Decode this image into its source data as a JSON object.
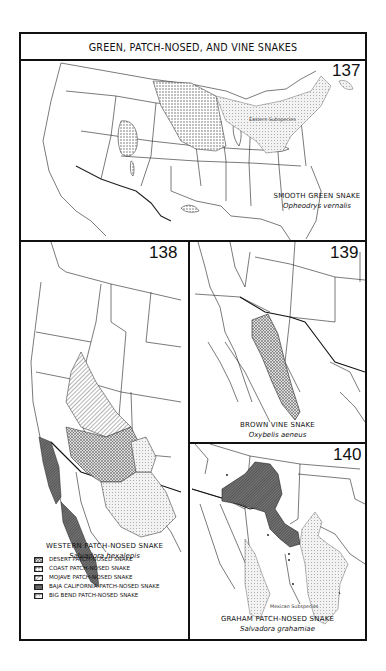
{
  "page": {
    "title": "GREEN, PATCH-NOSED, AND VINE SNAKES"
  },
  "maps": [
    {
      "number": "137",
      "common_name": "SMOOTH GREEN SNAKE",
      "scientific_name": "Opheodrys vernalis",
      "sublabel": "Eastern Subspecies"
    },
    {
      "number": "138",
      "common_name": "WESTERN PATCH-NOSED SNAKE",
      "scientific_name": "Salvadora hexalepis",
      "legend": [
        {
          "label": "DESERT PATCH-NOSED SNAKE",
          "pattern": "desert"
        },
        {
          "label": "COAST PATCH-NOSED SNAKE",
          "pattern": "coast"
        },
        {
          "label": "MOJAVE PATCH-NOSED SNAKE",
          "pattern": "mojave"
        },
        {
          "label": "BAJA CALIFORNIA PATCH-NOSED SNAKE",
          "pattern": "baja"
        },
        {
          "label": "BIG BEND PATCH-NOSED SNAKE",
          "pattern": "bigbend"
        }
      ]
    },
    {
      "number": "139",
      "common_name": "BROWN VINE SNAKE",
      "scientific_name": "Oxybelis aeneus"
    },
    {
      "number": "140",
      "common_name": "GRAHAM PATCH-NOSED SNAKE",
      "scientific_name": "Salvadora grahamiae",
      "sublabel": "Mexican Subspecies"
    }
  ],
  "colors": {
    "ink": "#111111",
    "stipple": "#c8c8c8",
    "dark_hatch": "#555555",
    "paper": "#ffffff"
  }
}
